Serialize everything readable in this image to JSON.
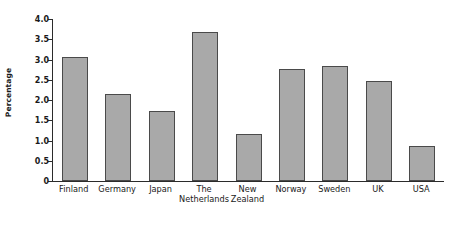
{
  "chart_data": {
    "type": "bar",
    "title": "",
    "subtitle": "",
    "xlabel": "",
    "ylabel": "Percentage",
    "categories": [
      "Finland",
      "Germany",
      "Japan",
      "The Netherlands",
      "New Zealand",
      "Norway",
      "Sweden",
      "UK",
      "USA"
    ],
    "category_lines": [
      [
        "Finland",
        ""
      ],
      [
        "Germany",
        ""
      ],
      [
        "Japan",
        ""
      ],
      [
        "The",
        "Netherlands"
      ],
      [
        "New",
        "Zealand"
      ],
      [
        "Norway",
        ""
      ],
      [
        "Sweden",
        ""
      ],
      [
        "UK",
        ""
      ],
      [
        "USA",
        ""
      ]
    ],
    "values": [
      3.07,
      2.16,
      1.73,
      3.67,
      1.17,
      2.77,
      2.84,
      2.46,
      0.87
    ],
    "ylim": [
      0,
      4.0
    ],
    "yticks": [
      0,
      0.5,
      1.0,
      1.5,
      2.0,
      2.5,
      3.0,
      3.5,
      4.0
    ],
    "ytick_labels": [
      "0",
      "0.5",
      "1.0",
      "1.5",
      "2.0",
      "2.5",
      "3.0",
      "3.5",
      "4.0"
    ],
    "grid": false,
    "legend": null,
    "legend_position": "none",
    "bar_color": "#a9a9a9",
    "bar_edge_color": "#4a4a4a",
    "axis_color": "#2b2b2b"
  },
  "caption": {
    "text": ""
  }
}
